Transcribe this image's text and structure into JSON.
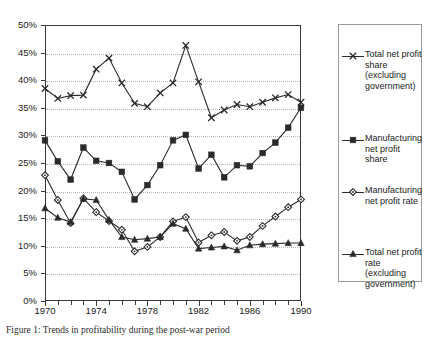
{
  "chart_data": {
    "type": "line",
    "title": "",
    "xlabel": "",
    "ylabel": "",
    "xlim": [
      1970,
      1990
    ],
    "ylim": [
      0,
      50
    ],
    "ytick_format": "percent",
    "grid": true,
    "legend_position": "right",
    "x": [
      1970,
      1971,
      1972,
      1973,
      1974,
      1975,
      1976,
      1977,
      1978,
      1979,
      1980,
      1981,
      1982,
      1983,
      1984,
      1985,
      1986,
      1987,
      1988,
      1989,
      1990
    ],
    "ytick_labels": [
      "0%",
      "5%",
      "10%",
      "15%",
      "20%",
      "25%",
      "30%",
      "35%",
      "40%",
      "45%",
      "50%"
    ],
    "ytick_values": [
      0,
      5,
      10,
      15,
      20,
      25,
      30,
      35,
      40,
      45,
      50
    ],
    "xtick_labels": [
      "1970",
      "1974",
      "1978",
      "1982",
      "1986",
      "1990"
    ],
    "xtick_values": [
      1970,
      1974,
      1978,
      1982,
      1986,
      1990
    ],
    "series": [
      {
        "name": "Total net profit share (excluding government)",
        "marker": "x",
        "values": [
          38.5,
          36.7,
          37.2,
          37.3,
          42.0,
          44.0,
          39.5,
          35.8,
          35.2,
          37.7,
          39.5,
          46.3,
          39.7,
          33.2,
          34.6,
          35.6,
          35.2,
          36.0,
          36.8,
          37.4,
          36.0
        ]
      },
      {
        "name": "Manufacturing net profit share",
        "marker": "square",
        "values": [
          29.1,
          25.3,
          22.0,
          27.8,
          25.4,
          25.0,
          23.4,
          18.4,
          21.0,
          24.6,
          29.1,
          30.1,
          24.0,
          26.5,
          22.4,
          24.6,
          24.4,
          26.8,
          28.7,
          31.4,
          35.0
        ]
      },
      {
        "name": "Manufacturing net profit rate",
        "marker": "diamond",
        "values": [
          22.8,
          18.3,
          14.1,
          18.6,
          16.1,
          14.5,
          12.9,
          9.0,
          9.8,
          11.6,
          14.4,
          15.2,
          10.6,
          11.9,
          12.5,
          10.9,
          11.6,
          13.6,
          15.3,
          17.0,
          18.4
        ]
      },
      {
        "name": "Total net profit rate (excluding government)",
        "marker": "triangle",
        "values": [
          16.8,
          15.1,
          14.3,
          18.5,
          18.3,
          14.7,
          11.6,
          11.1,
          11.3,
          11.6,
          14.0,
          13.1,
          9.5,
          9.7,
          9.9,
          9.2,
          10.1,
          10.3,
          10.4,
          10.5,
          10.5
        ]
      }
    ]
  },
  "legend": {
    "entries": [
      {
        "label": "Total net profit share (excluding government)",
        "marker": "x"
      },
      {
        "label": "Manufacturing net profit share",
        "marker": "square"
      },
      {
        "label": "Manufacturing net profit rate",
        "marker": "diamond"
      },
      {
        "label": "Total net profit rate (excluding government)",
        "marker": "triangle"
      }
    ]
  },
  "caption": {
    "text": "Figure 1: Trends in profitability during the post-war period"
  },
  "colors": {
    "line": "#2a2a2a",
    "axis": "#3a3a3a",
    "grid": "#b4b4b4",
    "text": "#1a1a1a"
  }
}
